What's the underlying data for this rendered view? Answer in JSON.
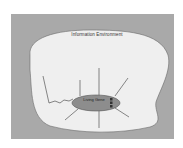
{
  "diagram": {
    "region_label": "Information Environment",
    "center_label": "Living Gene",
    "colors": {
      "frame": "#a9a9a9",
      "blob": "#efefef",
      "ellipse": "#8d8d8d",
      "lines": "#555555"
    },
    "arrows": [
      {
        "direction": "up-left-wavy"
      },
      {
        "direction": "up"
      },
      {
        "direction": "up-tall"
      },
      {
        "direction": "up-right"
      },
      {
        "direction": "down-left"
      },
      {
        "direction": "down"
      },
      {
        "direction": "down-right"
      }
    ]
  }
}
